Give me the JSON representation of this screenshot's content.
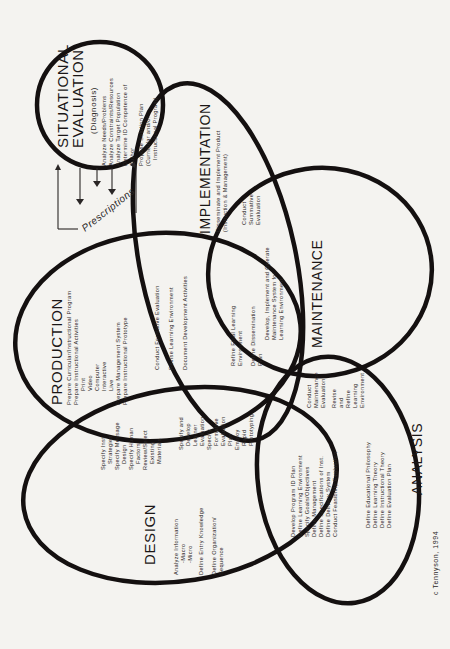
{
  "diagram": {
    "situational_evaluation": {
      "title_line1": "SITUATIONAL",
      "title_line2": "EVALUATION",
      "subtitle": "(Diagnosis)",
      "items": [
        "Analyze Needs/Problems",
        "Analyze Constraints/Resources",
        "Analyze Target Population",
        "Determine ID Competence of",
        "Author",
        "Propose Solution Plan",
        "(Curricular and/or",
        "Instructional Program)"
      ]
    },
    "prescriptions_label": "Prescriptions",
    "implementation": {
      "title": "IMPLEMENTATION",
      "items": [
        "Disseminate and Implement Product",
        "(Instruction & Management)"
      ]
    },
    "implementation_maintenance_overlap": {
      "items": [
        "Conduct",
        "Summative",
        "Evaluation"
      ]
    },
    "maintenance": {
      "title": "MAINTENANCE",
      "items": [
        "Develop, Implement and Operate",
        "Maintenance System for",
        "Learning Environment"
      ]
    },
    "production": {
      "title": "PRODUCTION",
      "items": [
        "Prepare Curricular/Instructional Program",
        "Prepare Instructional Activities",
        "Print",
        "Video",
        "Computer",
        "Interactive",
        "Live",
        "Prepare Management System",
        "Prepare Instructional Prototype"
      ]
    },
    "production_implementation_overlap": {
      "items": [
        "Conduct Formative Evaluation",
        "Revise Learning Environment",
        "Document Development Activities"
      ]
    },
    "production_impl_maint_overlap": {
      "items": [
        "Refine Final Learning",
        "Environment",
        "Define Dissemination",
        "Plan"
      ]
    },
    "design_production_overlap": {
      "items": [
        "Specify Inst.",
        "Strategies",
        "Specify Message",
        "Design",
        "Specify Human",
        "Factors",
        "Review/Select",
        "Existing",
        "Materials"
      ]
    },
    "design_production_impl_overlap": {
      "items": [
        "Specify and",
        "Develop",
        "Learner",
        "Evaluation",
        "Specify",
        "Formative",
        "Evaluation",
        "Plan",
        "Employ",
        "Rapid",
        "Prototyping"
      ]
    },
    "design": {
      "title": "DESIGN",
      "items": [
        "Analyze Information",
        "-Macro",
        "-Micro",
        "Define Entry Knowledge",
        "Define Organization/",
        "Sequence"
      ]
    },
    "design_analysis_overlap": {
      "items": [
        "Develop Program ID Plan",
        "Define Learning Environment",
        "Specify Goals/Objectives",
        "Define Management",
        "Define Specifications of Inst.",
        "Define Delivery System",
        "Conduct Feasibility Evaluation"
      ]
    },
    "maintenance_analysis_overlap": {
      "items": [
        "Conduct",
        "Maintenance",
        "Evaluation",
        "Revise",
        "and",
        "Refine",
        "Learning",
        "Environment"
      ]
    },
    "analysis": {
      "title": "ANALYSIS",
      "items": [
        "Define Educational Philosophy",
        "Define Learning Theory",
        "Define Instructional Theory",
        "Define Evaluation Plan"
      ]
    },
    "copyright": "c Tennyson, 1994"
  },
  "colors": {
    "background": "#f4f3f0",
    "ink": "#141010"
  }
}
